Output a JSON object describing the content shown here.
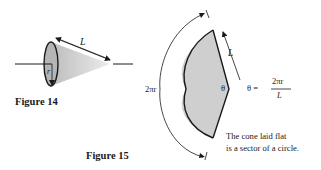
{
  "figure14": {
    "label": "Figure 14",
    "cone": {
      "slant_label": "L",
      "radius_label": "r",
      "fill_color": "#c8c8c8"
    }
  },
  "figure15": {
    "label": "Figure 15",
    "sector": {
      "arc_label": "2πr",
      "slant_label": "L",
      "angle_label": "θ",
      "fill_color": "#cfcfcf"
    },
    "formula": {
      "lhs": "θ =",
      "numerator": "2πr",
      "denominator": "L"
    },
    "caption": {
      "line1": "The cone laid flat",
      "line2": "is a sector of a circle."
    }
  }
}
